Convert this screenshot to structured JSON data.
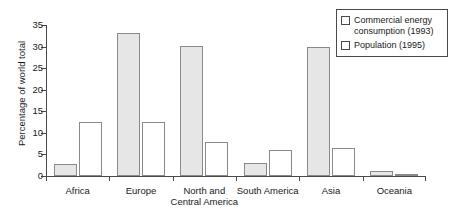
{
  "chart_data": {
    "type": "bar",
    "title": "",
    "xlabel": "",
    "ylabel": "Percentage of world total",
    "ylim": [
      0,
      35
    ],
    "yticks": [
      0,
      5,
      10,
      15,
      20,
      25,
      30,
      35
    ],
    "grid": false,
    "legend_position": "top-right",
    "categories": [
      "Africa",
      "Europe",
      "North and\nCentral America",
      "South America",
      "Asia",
      "Oceania"
    ],
    "series": [
      {
        "name": "Commercial energy consumption (1993)",
        "style": "shaded",
        "values": [
          2.7,
          33.2,
          30.2,
          3.0,
          29.8,
          1.2
        ]
      },
      {
        "name": "Population (1995)",
        "style": "open",
        "values": [
          12.5,
          12.5,
          8.0,
          6.0,
          6.5,
          0.5
        ]
      }
    ]
  },
  "axis": {
    "y_title": "Percentage of world total",
    "y_tick_labels": [
      "0",
      "5",
      "10",
      "15",
      "20",
      "25",
      "30",
      "35"
    ]
  },
  "legend": {
    "items": [
      {
        "label": "Commercial energy consumption (1993)",
        "swatch": "open-square-icon"
      },
      {
        "label": "Population (1995)",
        "swatch": "open-square-icon"
      }
    ]
  },
  "colors": {
    "shaded_bar_fill": "#e6e6e6",
    "bar_border": "#8a8a8a",
    "axis": "#4a4a4a",
    "text": "#1a1a1a",
    "background": "#ffffff"
  }
}
